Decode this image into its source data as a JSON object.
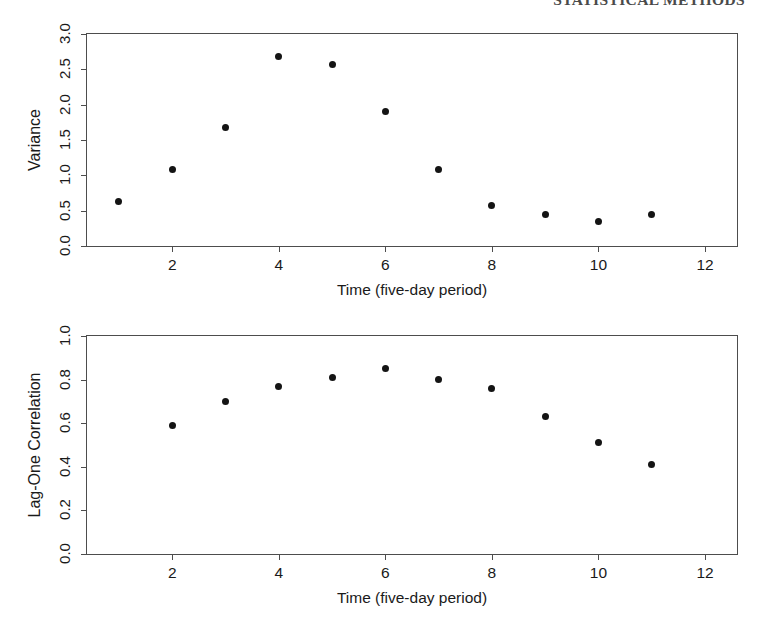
{
  "header": {
    "running_head": "STATISTICAL METHODS"
  },
  "figure": {
    "panels": [
      {
        "id": "variance",
        "name": "variance-panel"
      },
      {
        "id": "lagone",
        "name": "lag-one-correlation-panel"
      }
    ]
  },
  "chart_data": [
    {
      "type": "scatter",
      "title": "",
      "xlabel": "Time (five-day period)",
      "ylabel": "Variance",
      "xlim": [
        0.4,
        12.6
      ],
      "ylim": [
        0.0,
        3.0
      ],
      "xticks": [
        2,
        4,
        6,
        8,
        10,
        12
      ],
      "xtick_labels": [
        "2",
        "4",
        "6",
        "8",
        "10",
        "12"
      ],
      "yticks": [
        0.0,
        0.5,
        1.0,
        1.5,
        2.0,
        2.5,
        3.0
      ],
      "ytick_labels": [
        "0.0",
        "0.5",
        "1.0",
        "1.5",
        "2.0",
        "2.5",
        "3.0"
      ],
      "grid": false,
      "legend": false,
      "marker": "filled-circle",
      "marker_color": "#141414",
      "x": [
        1,
        2,
        3,
        4,
        5,
        6,
        7,
        8,
        9,
        10,
        11
      ],
      "values": [
        0.63,
        1.08,
        1.68,
        2.68,
        2.57,
        1.9,
        1.08,
        0.58,
        0.44,
        0.34,
        0.44
      ]
    },
    {
      "type": "scatter",
      "title": "",
      "xlabel": "Time (five-day period)",
      "ylabel": "Lag-One Correlation",
      "xlim": [
        0.4,
        12.6
      ],
      "ylim": [
        0.0,
        1.0
      ],
      "xticks": [
        2,
        4,
        6,
        8,
        10,
        12
      ],
      "xtick_labels": [
        "2",
        "4",
        "6",
        "8",
        "10",
        "12"
      ],
      "yticks": [
        0.0,
        0.2,
        0.4,
        0.6,
        0.8,
        1.0
      ],
      "ytick_labels": [
        "0.0",
        "0.2",
        "0.4",
        "0.6",
        "0.8",
        "1.0"
      ],
      "grid": false,
      "legend": false,
      "marker": "filled-circle",
      "marker_color": "#141414",
      "x": [
        2,
        3,
        4,
        5,
        6,
        7,
        8,
        9,
        10,
        11
      ],
      "values": [
        0.59,
        0.7,
        0.77,
        0.81,
        0.85,
        0.8,
        0.76,
        0.63,
        0.51,
        0.41
      ]
    }
  ]
}
